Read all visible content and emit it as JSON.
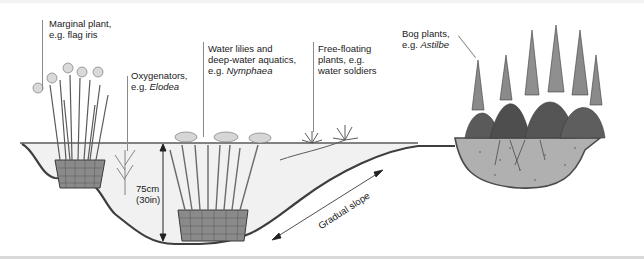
{
  "diagram": {
    "labels": {
      "marginal": {
        "line1": "Marginal plant,",
        "line2": "e.g. flag iris"
      },
      "oxygenators": {
        "line1": "Oxygenators,",
        "prefix": "e.g. ",
        "italic": "Elodea"
      },
      "water_lilies": {
        "line1": "Water lilies and",
        "line2": "deep-water aquatics,",
        "prefix": "e.g. ",
        "italic": "Nymphaea"
      },
      "free_floating": {
        "line1": "Free-floating",
        "line2": "plants, e.g.",
        "line3": "water soldiers"
      },
      "bog": {
        "line1": "Bog plants,",
        "prefix": "e.g. ",
        "italic": "Astilbe"
      }
    },
    "depth": {
      "metric": "75cm",
      "imperial": "(30in)"
    },
    "slope_label": "Gradual slope",
    "colors": {
      "water": "#f3f3f3",
      "liner": "#4a4a4a",
      "soil": "#a8a8a8",
      "plant_dark": "#555555",
      "plant_light": "#9a9a9a",
      "basket": "#7a7a7a"
    }
  }
}
